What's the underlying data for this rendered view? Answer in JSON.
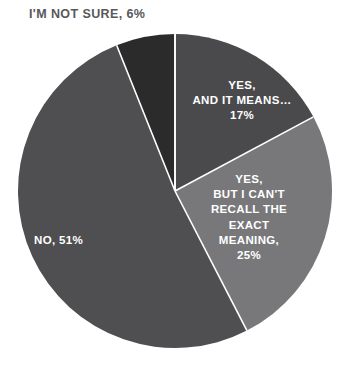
{
  "chart_data": {
    "type": "pie",
    "title": "",
    "subtitle": "",
    "xlabel": "",
    "ylabel": "",
    "legend_position": "none",
    "grid": false,
    "total": 99,
    "units": "%",
    "start_angle_deg": 0,
    "direction": "clockwise",
    "categories": [
      "I'M NOT SURE",
      "YES, AND IT MEANS…",
      "YES, BUT I CAN'T RECALL THE EXACT MEANING",
      "NO"
    ],
    "values": [
      6,
      17,
      25,
      51
    ],
    "slices": [
      {
        "name": "i-m-not-sure",
        "category": "I'M NOT SURE",
        "value": 6,
        "value_text": "6%",
        "label_text": "I'M NOT SURE, 6%",
        "label_lines": [
          "I'M NOT SURE, 6%"
        ],
        "color": "#2b2b2b",
        "label_placement": "outside",
        "label_color": "#58585a"
      },
      {
        "name": "yes-and-it-means",
        "category": "YES, AND IT MEANS…",
        "value": 17,
        "value_text": "17%",
        "label_text": "YES, AND IT MEANS… 17%",
        "label_lines": [
          "YES,",
          "AND IT MEANS…",
          "17%"
        ],
        "color": "#4a4a4c",
        "label_placement": "inside",
        "label_color": "#ffffff"
      },
      {
        "name": "yes-but-i-cant-recall",
        "category": "YES, BUT I CAN'T RECALL THE EXACT MEANING",
        "value": 25,
        "value_text": "25%",
        "label_text": "YES, BUT I CAN'T RECALL THE EXACT MEANING, 25%",
        "label_lines": [
          "YES,",
          "BUT I CAN'T",
          "RECALL THE",
          "EXACT",
          "MEANING,",
          "25%"
        ],
        "color": "#78787a",
        "label_placement": "inside",
        "label_color": "#ffffff"
      },
      {
        "name": "no",
        "category": "NO",
        "value": 51,
        "value_text": "51%",
        "label_text": "NO, 51%",
        "label_lines": [
          "NO, 51%"
        ],
        "color": "#4f4f51",
        "label_placement": "inside",
        "label_color": "#ffffff"
      }
    ],
    "geometry": {
      "center_x": 175,
      "center_y": 191,
      "radius": 157,
      "separator_color": "#ffffff",
      "separator_width": 1.6,
      "background": "#ffffff"
    },
    "leader_line": {
      "color": "#8d8d8f",
      "width": 1
    }
  }
}
